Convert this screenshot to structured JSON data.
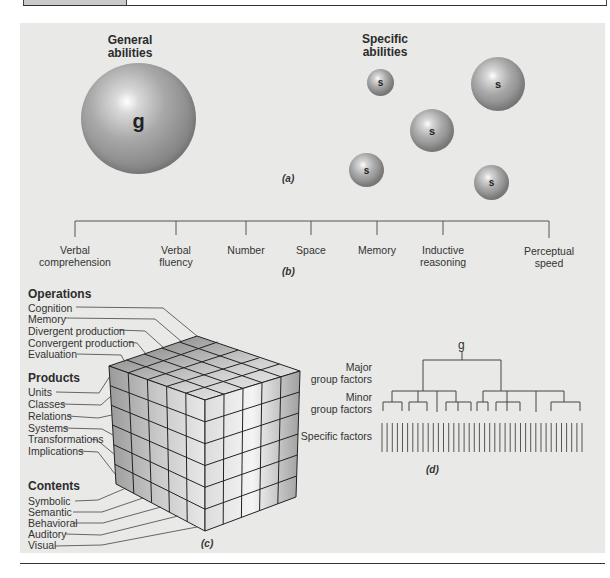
{
  "figure": {
    "panel_a": {
      "caption": "(a)",
      "general_heading_line1": "General",
      "general_heading_line2": "abilities",
      "specific_heading_line1": "Specific",
      "specific_heading_line2": "abilities",
      "general_sphere_label": "g",
      "specific_sphere_label": "s",
      "specific_sphere_count": 5
    },
    "panel_b": {
      "caption": "(b)",
      "abilities": [
        {
          "line1": "Verbal",
          "line2": "comprehension"
        },
        {
          "line1": "Verbal",
          "line2": "fluency"
        },
        {
          "line1": "Number",
          "line2": ""
        },
        {
          "line1": "Space",
          "line2": ""
        },
        {
          "line1": "Memory",
          "line2": ""
        },
        {
          "line1": "Inductive",
          "line2": "reasoning"
        },
        {
          "line1": "Perceptual",
          "line2": "speed"
        }
      ]
    },
    "panel_c": {
      "caption": "(c)",
      "operations_heading": "Operations",
      "operations": [
        "Cognition",
        "Memory",
        "Divergent production",
        "Convergent production",
        "Evaluation"
      ],
      "products_heading": "Products",
      "products": [
        "Units",
        "Classes",
        "Relations",
        "Systems",
        "Transformations",
        "Implications"
      ],
      "contents_heading": "Contents",
      "contents": [
        "Symbolic",
        "Semantic",
        "Behavioral",
        "Auditory",
        "Visual"
      ]
    },
    "panel_d": {
      "caption": "(d)",
      "top_label": "g",
      "major_label_line1": "Major",
      "major_label_line2": "group factors",
      "minor_label_line1": "Minor",
      "minor_label_line2": "group factors",
      "specific_label": "Specific factors",
      "specific_factor_count": 40
    }
  }
}
